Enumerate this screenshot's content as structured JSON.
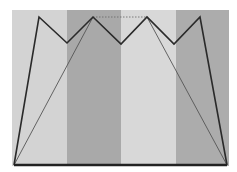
{
  "canvas": {
    "width": 237,
    "height": 172,
    "background": "#ffffff"
  },
  "background_region": {
    "x": 12,
    "y": 10,
    "width": 217,
    "height": 156
  },
  "stripes": [
    {
      "x": 12,
      "width": 55,
      "color": "#d3d3d3"
    },
    {
      "x": 67,
      "width": 54,
      "color": "#a9a9a9"
    },
    {
      "x": 121,
      "width": 55,
      "color": "#d8d8d8"
    },
    {
      "x": 176,
      "width": 53,
      "color": "#acacac"
    }
  ],
  "outer_outline": {
    "stroke": "#2a2a2a",
    "stroke_width": 1.6,
    "points": [
      [
        14,
        165
      ],
      [
        39,
        17
      ],
      [
        67,
        43
      ],
      [
        93,
        17
      ],
      [
        121,
        44
      ],
      [
        147,
        17
      ],
      [
        174,
        44
      ],
      [
        200,
        17
      ],
      [
        227,
        165
      ]
    ]
  },
  "base_line": {
    "stroke": "#222222",
    "stroke_width": 2.4,
    "from": [
      14,
      165
    ],
    "to": [
      227,
      165
    ]
  },
  "inner_lines": [
    {
      "from": [
        14,
        165
      ],
      "to": [
        93,
        17
      ],
      "stroke": "#555555",
      "stroke_width": 0.9,
      "dashed": false
    },
    {
      "from": [
        147,
        17
      ],
      "to": [
        227,
        165
      ],
      "stroke": "#555555",
      "stroke_width": 0.9,
      "dashed": false
    },
    {
      "from": [
        93,
        17
      ],
      "to": [
        147,
        17
      ],
      "stroke": "#666666",
      "stroke_width": 0.8,
      "dashed": true
    }
  ]
}
